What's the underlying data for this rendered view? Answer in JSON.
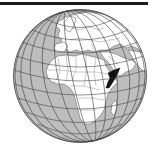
{
  "map": {
    "type": "orthographic-globe-locator",
    "highlighted_region": "Somalia",
    "visible_regions": [
      "Europe",
      "Africa",
      "Arabian Peninsula",
      "Middle East",
      "Atlantic Ocean",
      "Indian Ocean",
      "Madagascar"
    ],
    "colors": {
      "ocean": "#bdbdbd",
      "land": "#ffffff",
      "highlight": "#111111",
      "borders": "#555555",
      "graticule": "#3a3a3a",
      "rule": "#1a1a1a"
    }
  }
}
